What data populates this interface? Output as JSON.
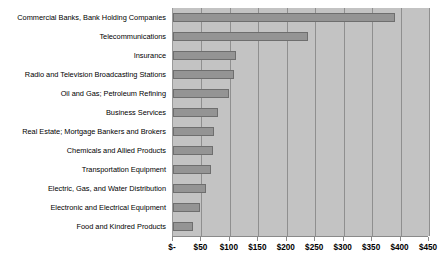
{
  "chart_data": {
    "type": "bar",
    "orientation": "horizontal",
    "title": "",
    "subtitle": "",
    "xlabel": "",
    "ylabel": "",
    "xlim": [
      0,
      450
    ],
    "grid": true,
    "legend": null,
    "tick_prefix": "$",
    "tick_labels": [
      "$-",
      "$50",
      "$100",
      "$150",
      "$200",
      "$250",
      "$300",
      "$350",
      "$400",
      "$450"
    ],
    "tick_values": [
      0,
      50,
      100,
      150,
      200,
      250,
      300,
      350,
      400,
      450
    ],
    "categories": [
      "Commercial Banks, Bank Holding Companies",
      "Telecommunications",
      "Insurance",
      "Radio and Television Broadcasting Stations",
      "Oil and Gas; Petroleum Refining",
      "Business Services",
      "Real Estate; Mortgage Bankers and Brokers",
      "Chemicals and Allied Products",
      "Transportation Equipment",
      "Electric, Gas, and Water Distribution",
      "Electronic and Electrical Equipment",
      "Food and Kindred Products"
    ],
    "values": [
      390,
      238,
      110,
      107,
      98,
      79,
      72,
      70,
      66,
      58,
      48,
      36
    ],
    "colors": {
      "bar_fill": "#949494",
      "bar_border": "#6e6e6e",
      "plot_background": "#c3c3c3",
      "gridline": "#8f8f8f",
      "axis": "#8a8a8a",
      "text": "#000000",
      "page_background": "#ffffff"
    }
  }
}
